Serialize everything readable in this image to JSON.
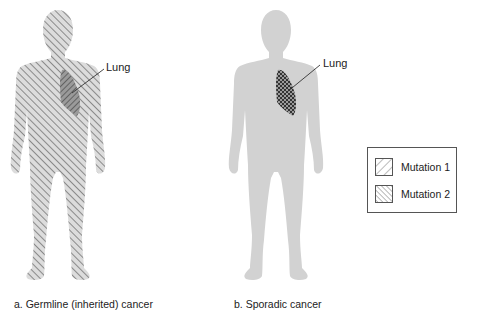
{
  "figure": {
    "panels": [
      {
        "id": "a",
        "caption": "a. Germline (inherited) cancer",
        "organ_label": "Lung",
        "body_pattern": "mutation-1-hatch",
        "organ_pattern": "mutation-1-and-2-hatch"
      },
      {
        "id": "b",
        "caption": "b. Sporadic cancer",
        "organ_label": "Lung",
        "body_pattern": "solid-gray",
        "organ_pattern": "mutation-1-and-2-crosshatch"
      }
    ],
    "legend": {
      "items": [
        {
          "label": "Mutation 1",
          "pattern": "forward-diagonal-hatch"
        },
        {
          "label": "Mutation 2",
          "pattern": "back-diagonal-hatch"
        }
      ]
    },
    "colors": {
      "body_fill": "#cfcfcf",
      "hatch_stroke": "#8a8a8a",
      "organ_stroke": "#444444",
      "leader_line": "#333333",
      "text": "#222222"
    }
  }
}
